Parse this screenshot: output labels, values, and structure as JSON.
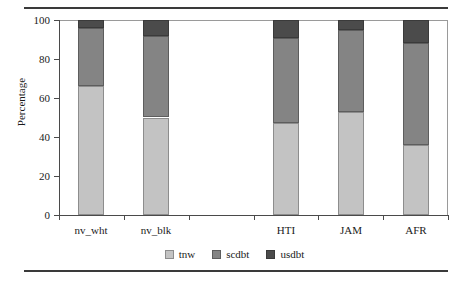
{
  "chart_data": {
    "type": "bar",
    "subtype": "stacked-bar-100",
    "title": "",
    "xlabel": "",
    "ylabel": "Percentage",
    "ylim": [
      0,
      100
    ],
    "yticks": [
      0,
      20,
      40,
      60,
      80,
      100
    ],
    "grid": false,
    "legend_position": "bottom-center",
    "categories": [
      "nv_wht",
      "nv_blk",
      "",
      "HTI",
      "JAM",
      "AFR"
    ],
    "series": [
      {
        "name": "tnw",
        "color": "#c3c3c3",
        "values": [
          66,
          50,
          null,
          47,
          53,
          36
        ]
      },
      {
        "name": "scdbt",
        "color": "#848484",
        "values": [
          30,
          42,
          null,
          44,
          42,
          52
        ]
      },
      {
        "name": "usdbt",
        "color": "#4b4b4b",
        "values": [
          4,
          8,
          null,
          9,
          5,
          12
        ]
      }
    ],
    "cumulative_tops": {
      "tnw": [
        66,
        50,
        null,
        47,
        53,
        36
      ],
      "scdbt": [
        96,
        92,
        null,
        91,
        95,
        88
      ],
      "usdbt": [
        100,
        100,
        null,
        100,
        100,
        100
      ]
    }
  },
  "axis": {
    "y_title": "Percentage",
    "y_tick_labels": [
      "0",
      "20",
      "40",
      "60",
      "80",
      "100"
    ],
    "x_tick_labels": [
      "nv_wht",
      "nv_blk",
      "",
      "HTI",
      "JAM",
      "AFR"
    ]
  },
  "legend": {
    "items": [
      {
        "label": "tnw",
        "color": "#c3c3c3"
      },
      {
        "label": "scdbt",
        "color": "#848484"
      },
      {
        "label": "usdbt",
        "color": "#4b4b4b"
      }
    ]
  },
  "rules": {
    "top_rule_color": "#3a3a3a",
    "bottom_rule_color": "#3a3a3a"
  }
}
